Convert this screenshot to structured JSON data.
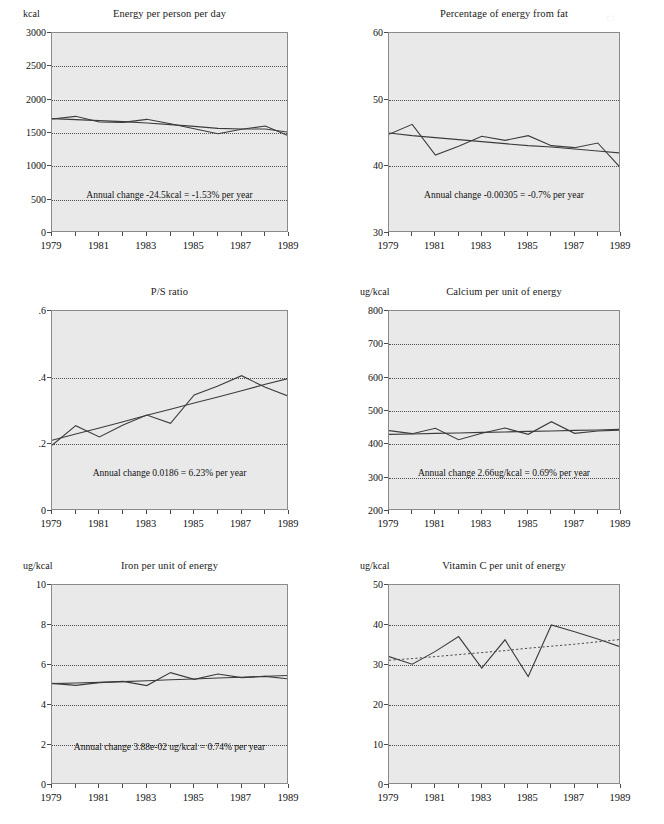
{
  "page": {
    "width": 664,
    "height": 824,
    "cut_off_top_line": "",
    "plot_bg_color": "#e9e9e9",
    "frame_color": "#8a8a8a",
    "grid_color": "#4f4f4f",
    "data_line_color": "#3c3c3c",
    "trend_line_color": "#4a4a4a"
  },
  "panels": [
    {
      "id": "energy-per-person-per-day",
      "title": "Energy per person per day",
      "y_unit": "kcal",
      "annotation": "Annual change  -24.5kcal = -1.53% per year",
      "chart_data": {
        "type": "line",
        "title": "Energy per person per day",
        "xlabel": "",
        "ylabel": "kcal",
        "xlim": [
          1979,
          1989
        ],
        "ylim": [
          0,
          3000
        ],
        "yticks": [
          0,
          500,
          1000,
          1500,
          2000,
          2500,
          3000
        ],
        "ytick_labels": [
          "0",
          "500",
          "1000",
          "1500",
          "2000",
          "2500",
          "3000"
        ],
        "xticks": [
          1979,
          1980,
          1981,
          1982,
          1983,
          1984,
          1985,
          1986,
          1987,
          1988,
          1989
        ],
        "xtick_labels": [
          "1979",
          "",
          "1981",
          "",
          "1983",
          "",
          "1985",
          "",
          "1987",
          "",
          "1989"
        ],
        "grid": true,
        "legend": "none",
        "x": [
          1979,
          1980,
          1981,
          1982,
          1983,
          1984,
          1985,
          1986,
          1987,
          1988,
          1989
        ],
        "series": [
          {
            "name": "observed",
            "style": "solid",
            "values": [
              1710,
              1750,
              1665,
              1660,
              1705,
              1640,
              1565,
              1490,
              1555,
              1605,
              1455
            ]
          },
          {
            "name": "trend",
            "style": "solid",
            "values": [
              1715,
              1700,
              1685,
              1670,
              1650,
              1625,
              1600,
              1570,
              1560,
              1560,
              1510
            ]
          }
        ],
        "annotation": "Annual change  -24.5kcal = -1.53% per year",
        "annual_change": "-24.5kcal",
        "annual_change_pct": "-1.53%"
      }
    },
    {
      "id": "percentage-of-energy-from-fat",
      "title": "Percentage of energy from fat",
      "y_unit": "",
      "annotation": "Annual change -0.00305 = -0.7% per year",
      "chart_data": {
        "type": "line",
        "title": "Percentage of energy from fat",
        "xlabel": "",
        "ylabel": "",
        "xlim": [
          1979,
          1989
        ],
        "ylim": [
          30,
          60
        ],
        "yticks": [
          30,
          40,
          50,
          60
        ],
        "ytick_labels": [
          "30",
          "40",
          "50",
          "60"
        ],
        "xticks": [
          1979,
          1980,
          1981,
          1982,
          1983,
          1984,
          1985,
          1986,
          1987,
          1988,
          1989
        ],
        "xtick_labels": [
          "1979",
          "",
          "1981",
          "",
          "1983",
          "",
          "1985",
          "",
          "1987",
          "",
          "1989"
        ],
        "grid": true,
        "legend": "none",
        "x": [
          1979,
          1980,
          1981,
          1982,
          1983,
          1984,
          1985,
          1986,
          1987,
          1988,
          1989
        ],
        "series": [
          {
            "name": "observed",
            "style": "solid",
            "values": [
              44.8,
              46.3,
              41.7,
              43.0,
              44.5,
              43.9,
              44.6,
              43.1,
              42.8,
              43.5,
              39.7
            ]
          },
          {
            "name": "trend",
            "style": "solid",
            "values": [
              45.0,
              44.6,
              44.3,
              44.0,
              43.7,
              43.4,
              43.1,
              42.9,
              42.6,
              42.3,
              42.0
            ]
          }
        ],
        "annotation": "Annual change -0.00305 = -0.7% per year",
        "annual_change": "-0.00305",
        "annual_change_pct": "-0.7%"
      }
    },
    {
      "id": "ps-ratio",
      "title": "P/S ratio",
      "y_unit": "",
      "annotation": "Annual change 0.0186 = 6.23% per year",
      "chart_data": {
        "type": "line",
        "title": "P/S ratio",
        "xlabel": "",
        "ylabel": "",
        "xlim": [
          1979,
          1989
        ],
        "ylim": [
          0,
          0.6
        ],
        "yticks": [
          0,
          0.2,
          0.4,
          0.6
        ],
        "ytick_labels": [
          "0",
          ".2",
          ".4",
          ".6"
        ],
        "xticks": [
          1979,
          1980,
          1981,
          1982,
          1983,
          1984,
          1985,
          1986,
          1987,
          1988,
          1989
        ],
        "xtick_labels": [
          "1979",
          "",
          "1981",
          "",
          "1983",
          "",
          "1985",
          "",
          "1987",
          "",
          "1989"
        ],
        "grid": true,
        "legend": "none",
        "x": [
          1979,
          1980,
          1981,
          1982,
          1983,
          1984,
          1985,
          1986,
          1987,
          1988,
          1989
        ],
        "series": [
          {
            "name": "observed",
            "style": "solid",
            "values": [
              0.197,
              0.256,
              0.222,
              0.258,
              0.288,
              0.263,
              0.348,
              0.375,
              0.406,
              0.371,
              0.344
            ]
          },
          {
            "name": "trend",
            "style": "solid",
            "values": [
              0.212,
              0.231,
              0.249,
              0.268,
              0.287,
              0.305,
              0.324,
              0.342,
              0.361,
              0.38,
              0.398
            ]
          }
        ],
        "annotation": "Annual change 0.0186 = 6.23% per year",
        "annual_change": "0.0186",
        "annual_change_pct": "6.23%"
      }
    },
    {
      "id": "calcium-per-unit-of-energy",
      "title": "Calcium per unit of energy",
      "y_unit": "ug/kcal",
      "annotation": "Annual change 2.66ug/kcal = 0.69% per year",
      "chart_data": {
        "type": "line",
        "title": "Calcium per unit of energy",
        "xlabel": "",
        "ylabel": "ug/kcal",
        "xlim": [
          1979,
          1989
        ],
        "ylim": [
          200,
          800
        ],
        "yticks": [
          200,
          300,
          400,
          500,
          600,
          700,
          800
        ],
        "ytick_labels": [
          "200",
          "300",
          "400",
          "500",
          "600",
          "700",
          "800"
        ],
        "xticks": [
          1979,
          1980,
          1981,
          1982,
          1983,
          1984,
          1985,
          1986,
          1987,
          1988,
          1989
        ],
        "xtick_labels": [
          "1979",
          "",
          "1981",
          "",
          "1983",
          "",
          "1985",
          "",
          "1987",
          "",
          "1989"
        ],
        "grid": true,
        "legend": "none",
        "x": [
          1979,
          1980,
          1981,
          1982,
          1983,
          1984,
          1985,
          1986,
          1987,
          1988,
          1989
        ],
        "series": [
          {
            "name": "observed",
            "style": "solid",
            "values": [
              441,
              432,
              448,
              414,
              433,
              449,
              430,
              468,
              433,
              440,
              443
            ]
          },
          {
            "name": "trend",
            "style": "solid",
            "values": [
              430,
              431,
              433,
              434,
              436,
              437,
              439,
              440,
              442,
              443,
              445
            ]
          }
        ],
        "annotation": "Annual change 2.66ug/kcal = 0.69% per year",
        "annual_change": "2.66ug/kcal",
        "annual_change_pct": "0.69%"
      }
    },
    {
      "id": "iron-per-unit-of-energy",
      "title": "Iron per unit of energy",
      "y_unit": "ug/kcal",
      "annotation": "Annual change 3.88e-02 ug/kcal = 0.74% per year",
      "chart_data": {
        "type": "line",
        "title": "Iron per unit of energy",
        "xlabel": "",
        "ylabel": "ug/kcal",
        "xlim": [
          1979,
          1989
        ],
        "ylim": [
          0,
          10
        ],
        "yticks": [
          0,
          2,
          4,
          6,
          8,
          10
        ],
        "ytick_labels": [
          "0",
          "2",
          "4",
          "6",
          "8",
          "10"
        ],
        "xticks": [
          1979,
          1980,
          1981,
          1982,
          1983,
          1984,
          1985,
          1986,
          1987,
          1988,
          1989
        ],
        "xtick_labels": [
          "1979",
          "",
          "1981",
          "",
          "1983",
          "",
          "1985",
          "",
          "1987",
          "",
          "1989"
        ],
        "grid": true,
        "legend": "none",
        "x": [
          1979,
          1980,
          1981,
          1982,
          1983,
          1984,
          1985,
          1986,
          1987,
          1988,
          1989
        ],
        "series": [
          {
            "name": "observed",
            "style": "solid",
            "values": [
              5.08,
              4.98,
              5.12,
              5.18,
              4.97,
              5.62,
              5.28,
              5.55,
              5.37,
              5.43,
              5.3
            ]
          },
          {
            "name": "trend",
            "style": "solid",
            "values": [
              5.07,
              5.1,
              5.13,
              5.17,
              5.21,
              5.26,
              5.3,
              5.35,
              5.39,
              5.44,
              5.48
            ]
          }
        ],
        "annotation": "Annual change 3.88e-02 ug/kcal = 0.74% per year",
        "annual_change": "3.88e-02 ug/kcal",
        "annual_change_pct": "0.74%"
      }
    },
    {
      "id": "vitamin-c-per-unit-of-energy",
      "title": "Vitamin C per unit of energy",
      "y_unit": "ug/kcal",
      "annotation": "",
      "chart_data": {
        "type": "line",
        "title": "Vitamin C per unit of energy",
        "xlabel": "",
        "ylabel": "ug/kcal",
        "xlim": [
          1979,
          1989
        ],
        "ylim": [
          0,
          50
        ],
        "yticks": [
          0,
          10,
          20,
          30,
          40,
          50
        ],
        "ytick_labels": [
          "0",
          "10",
          "20",
          "30",
          "40",
          "50"
        ],
        "xticks": [
          1979,
          1980,
          1981,
          1982,
          1983,
          1984,
          1985,
          1986,
          1987,
          1988,
          1989
        ],
        "xtick_labels": [
          "1979",
          "",
          "1981",
          "",
          "1983",
          "",
          "1985",
          "",
          "1987",
          "",
          "1989"
        ],
        "grid": true,
        "legend": "none",
        "x": [
          1979,
          1980,
          1981,
          1982,
          1983,
          1984,
          1985,
          1986,
          1987,
          1988,
          1989
        ],
        "series": [
          {
            "name": "observed",
            "style": "solid",
            "values": [
              32.1,
              30.2,
              33.4,
              37.1,
              29.2,
              36.3,
              27.1,
              40.0,
              38.3,
              36.5,
              34.5
            ]
          },
          {
            "name": "trend",
            "style": "dotted",
            "values": [
              31.2,
              31.6,
              32.1,
              32.6,
              33.1,
              33.6,
              34.2,
              34.7,
              35.2,
              35.8,
              36.4
            ]
          }
        ],
        "annotation": "",
        "annual_change": "",
        "annual_change_pct": ""
      }
    }
  ]
}
